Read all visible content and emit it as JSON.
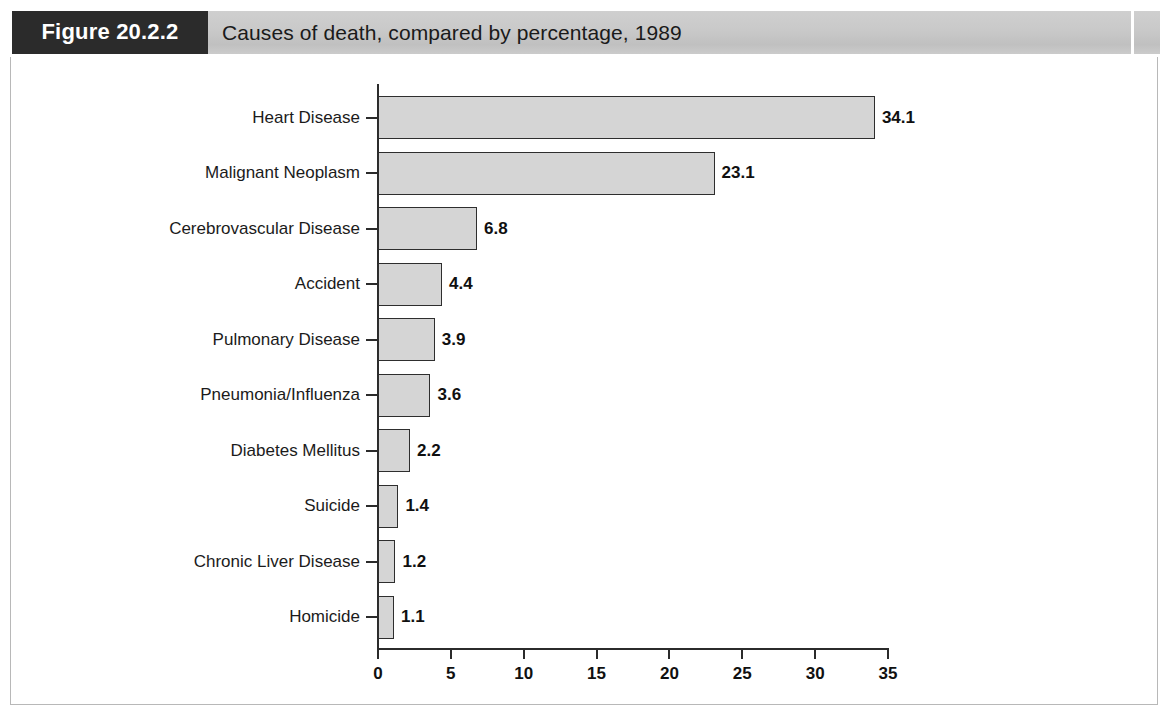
{
  "figure": {
    "tag": "Figure 20.2.2",
    "title": "Causes of death, compared by percentage, 1989"
  },
  "colors": {
    "tag_background": "#2b2b2b",
    "header_band": "#c9c9c9",
    "bar_fill": "#d5d5d5",
    "bar_stroke": "#2e2e2e",
    "axis": "#2b2b2b",
    "text": "#1a1a1a",
    "frame": "#b8b8b8"
  },
  "chart_data": {
    "type": "bar",
    "orientation": "horizontal",
    "title": "Causes of death, compared by percentage, 1989",
    "xlabel": "",
    "ylabel": "",
    "categories": [
      "Heart Disease",
      "Malignant Neoplasm",
      "Cerebrovascular Disease",
      "Accident",
      "Pulmonary Disease",
      "Pneumonia/Influenza",
      "Diabetes Mellitus",
      "Suicide",
      "Chronic Liver Disease",
      "Homicide"
    ],
    "values": [
      34.1,
      23.1,
      6.8,
      4.4,
      3.9,
      3.6,
      2.2,
      1.4,
      1.2,
      1.1
    ],
    "value_labels": [
      "34.1",
      "23.1",
      "6.8",
      "4.4",
      "3.9",
      "3.6",
      "2.2",
      "1.4",
      "1.2",
      "1.1"
    ],
    "xlim": [
      0,
      35
    ],
    "xticks": [
      0,
      5,
      10,
      15,
      20,
      25,
      30,
      35
    ],
    "xtick_labels": [
      "0",
      "5",
      "10",
      "15",
      "20",
      "25",
      "30",
      "35"
    ],
    "grid": false,
    "legend": false
  }
}
